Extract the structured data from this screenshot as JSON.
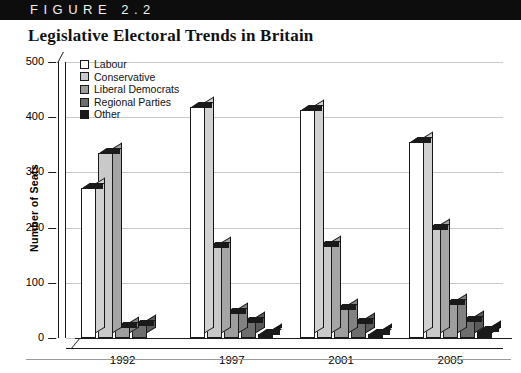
{
  "figure": {
    "bar_label": "FIGURE 2.2",
    "title": "Legislative Electoral Trends in Britain"
  },
  "chart_data": {
    "type": "bar",
    "title": "Legislative Electoral Trends in Britain",
    "xlabel": "",
    "ylabel": "Number of Seats",
    "ylim": [
      0,
      500
    ],
    "yticks": [
      0,
      100,
      200,
      300,
      400,
      500
    ],
    "grid": true,
    "legend_position": "top-left",
    "categories": [
      "1992",
      "1997",
      "2001",
      "2005"
    ],
    "series": [
      {
        "name": "Labour",
        "color": "#ffffff",
        "values": [
          271,
          418,
          413,
          355
        ]
      },
      {
        "name": "Conservative",
        "color": "#c9c9c9",
        "values": [
          336,
          165,
          166,
          198
        ]
      },
      {
        "name": "Liberal Democrats",
        "color": "#9e9e9e",
        "values": [
          20,
          46,
          52,
          62
        ]
      },
      {
        "name": "Regional Parties",
        "color": "#6e6e6e",
        "values": [
          24,
          29,
          28,
          30
        ]
      },
      {
        "name": "Other",
        "color": "#1a1a1a",
        "values": [
          0,
          7,
          8,
          12
        ]
      }
    ]
  },
  "colors": {
    "header_bar": "#0d0d0d",
    "header_text": "#f2f2f2",
    "gridline": "#c9c9c9",
    "axis": "#1a1a1a"
  }
}
